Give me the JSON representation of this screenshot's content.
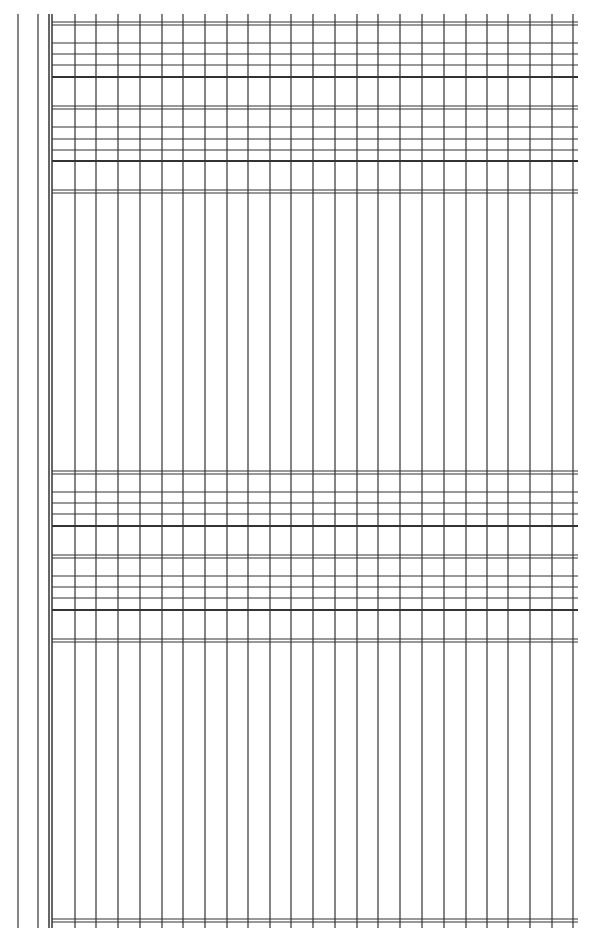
{
  "document": {
    "type": "blank ledger grid form",
    "background": "#ffffff",
    "line_color": "#333333",
    "frame": {
      "left_margin_lines_x": [
        18,
        38
      ],
      "left_double_border_x": [
        49,
        52
      ],
      "grid_right_x": 578,
      "grid_top_y": 20,
      "grid_bottom_y": 928
    },
    "columns_x": [
      75,
      96,
      118,
      140,
      162,
      183,
      205,
      227,
      248,
      270,
      291,
      313,
      335,
      357,
      378,
      400,
      422,
      444,
      466,
      487,
      508,
      530,
      552,
      573
    ],
    "bands": [
      {
        "double_top_y": 22,
        "thin_lines_y": [
          43,
          54,
          65
        ],
        "thick_line_y": 77
      },
      {
        "double_top_y": 106,
        "thin_lines_y": [
          127,
          139,
          150
        ],
        "thick_line_y": 161
      },
      {
        "double_top_y": 190,
        "thin_lines_y": [],
        "thick_line_y": null
      },
      {
        "double_top_y": 471,
        "thin_lines_y": [
          492,
          503,
          514
        ],
        "thick_line_y": 526
      },
      {
        "double_top_y": 555,
        "thin_lines_y": [
          576,
          587,
          598
        ],
        "thick_line_y": 610
      },
      {
        "double_top_y": 639,
        "thin_lines_y": [],
        "thick_line_y": null
      },
      {
        "double_top_y": 919,
        "thin_lines_y": [],
        "thick_line_y": null
      }
    ]
  }
}
